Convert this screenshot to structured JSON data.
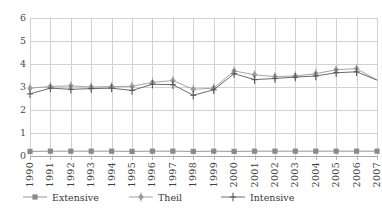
{
  "chart_data": {
    "type": "line",
    "title": "",
    "subtitle": "",
    "xlabel": "",
    "ylabel": "",
    "xlim": [
      1990,
      2007
    ],
    "ylim": [
      0,
      6
    ],
    "ytick_step": 1,
    "grid": "both",
    "legend_position": "bottom",
    "categories": [
      "1990",
      "1991",
      "1992",
      "1993",
      "1994",
      "1995",
      "1996",
      "1997",
      "1998",
      "1999",
      "2000",
      "2001",
      "2002",
      "2003",
      "2004",
      "2005",
      "2006",
      "2007"
    ],
    "yticks": [
      "0",
      "1",
      "2",
      "3",
      "4",
      "5",
      "6"
    ],
    "series": [
      {
        "name": "Extensive",
        "marker": "square",
        "color": "#8a8a8a",
        "values": [
          0.2,
          0.21,
          0.21,
          0.21,
          0.21,
          0.2,
          0.21,
          0.21,
          0.2,
          0.21,
          0.2,
          0.21,
          0.21,
          0.21,
          0.21,
          0.21,
          0.21,
          0.21
        ]
      },
      {
        "name": "Theil",
        "marker": "diamond",
        "color": "#9a9a9a",
        "values": [
          2.95,
          3.02,
          3.05,
          3.0,
          3.02,
          3.03,
          3.2,
          3.28,
          2.9,
          2.95,
          3.7,
          3.53,
          3.45,
          3.48,
          3.58,
          3.75,
          3.8,
          3.3
        ]
      },
      {
        "name": "Intensive",
        "marker": "plus",
        "color": "#5a5a5a",
        "values": [
          2.7,
          2.95,
          2.9,
          2.93,
          2.95,
          2.85,
          3.12,
          3.1,
          2.64,
          2.88,
          3.58,
          3.32,
          3.37,
          3.43,
          3.48,
          3.62,
          3.66,
          3.3
        ]
      }
    ]
  },
  "legend": {
    "items": [
      {
        "label": "Extensive",
        "marker": "square-marker"
      },
      {
        "label": "Theil",
        "marker": "diamond-marker"
      },
      {
        "label": "Intensive",
        "marker": "plus-marker"
      }
    ]
  },
  "colors": {
    "grid": "#d2d2d2",
    "axis": "#a8a8a8",
    "extensive": "#8a8a8a",
    "theil": "#9a9a9a",
    "intensive": "#5a5a5a",
    "text": "#3a3a3a",
    "background": "#ffffff"
  }
}
